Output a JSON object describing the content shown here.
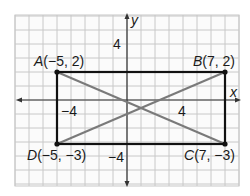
{
  "diagram": {
    "title": "",
    "grid": {
      "x_min": -8,
      "x_max": 8,
      "y_min": -6,
      "y_max": 6,
      "unit_px": 14,
      "origin_px": [
        127,
        100
      ],
      "grid_color": "#c8c8c8",
      "background": "#fbfbfb"
    },
    "axes": {
      "x_label": "x",
      "y_label": "y",
      "tick_labels": [
        {
          "id": "x_neg4",
          "text": "−4",
          "x": -4,
          "y": 0
        },
        {
          "id": "x_pos4",
          "text": "4",
          "x": 4,
          "y": 0
        },
        {
          "id": "y_pos4",
          "text": "4",
          "x": 0,
          "y": 4
        },
        {
          "id": "y_neg4",
          "text": "−4",
          "x": 0,
          "y": -4
        }
      ],
      "color": "#333333"
    },
    "points": [
      {
        "name": "A",
        "label": "A(−5, 2)",
        "x": -5,
        "y": 2
      },
      {
        "name": "B",
        "label": "B(7, 2)",
        "x": 7,
        "y": 2
      },
      {
        "name": "C",
        "label": "C(7, −3)",
        "x": 7,
        "y": -3
      },
      {
        "name": "D",
        "label": "D(−5, −3)",
        "x": -5,
        "y": -3
      }
    ],
    "rectangle": {
      "vertices": [
        "A",
        "B",
        "C",
        "D"
      ],
      "color": "#111111"
    },
    "diagonals": [
      {
        "from": "A",
        "to": "C",
        "color": "#7a7a7a"
      },
      {
        "from": "D",
        "to": "B",
        "color": "#7a7a7a"
      }
    ]
  },
  "text": {
    "x_axis": "x",
    "y_axis": "y",
    "tick_x_neg4": "−4",
    "tick_x_pos4": "4",
    "tick_y_pos4": "4",
    "tick_y_neg4": "−4",
    "A_name": "A",
    "A_coords": "(−5, 2)",
    "B_name": "B",
    "B_coords": "(7, 2)",
    "C_name": "C",
    "C_coords": "(7, −3)",
    "D_name": "D",
    "D_coords": "(−5, −3)"
  }
}
